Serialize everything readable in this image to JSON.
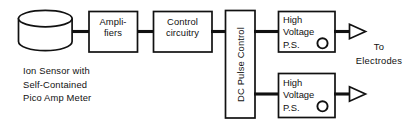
{
  "diagram": {
    "type": "block-diagram",
    "canvas": {
      "width": 417,
      "height": 126
    },
    "stroke_color": "#111111",
    "fill_color": "#ffffff",
    "background": "#ffffff",
    "nodes": [
      {
        "id": "ion-sensor",
        "shape": "cylinder",
        "label": "",
        "caption": "Ion Sensor with\nSelf-Contained\nPico Amp Meter"
      },
      {
        "id": "amplifiers",
        "shape": "rectangle",
        "label": "Ampli-\nfiers"
      },
      {
        "id": "control-circuitry",
        "shape": "rectangle",
        "label": "Control\ncircuitry"
      },
      {
        "id": "dc-pulse-control",
        "shape": "rectangle-vertical",
        "label": "DC Pulse Control",
        "text_orientation": "rotated-90-ccw"
      },
      {
        "id": "high-voltage-ps-upper",
        "shape": "rectangle",
        "label": "High\nVoltage\nP.S.",
        "has_knob": true
      },
      {
        "id": "high-voltage-ps-lower",
        "shape": "rectangle",
        "label": "High\nVoltage\nP.S.",
        "has_knob": true
      }
    ],
    "outputs": {
      "label": "To\nElectrodes",
      "arrow_style": "hollow-triangle",
      "count": 2
    },
    "edges": [
      {
        "from": "ion-sensor",
        "to": "amplifiers"
      },
      {
        "from": "amplifiers",
        "to": "control-circuitry"
      },
      {
        "from": "control-circuitry",
        "to": "dc-pulse-control"
      },
      {
        "from": "dc-pulse-control",
        "to": "high-voltage-ps-upper"
      },
      {
        "from": "dc-pulse-control",
        "to": "high-voltage-ps-lower"
      },
      {
        "from": "high-voltage-ps-upper",
        "to": "electrodes-output-upper"
      },
      {
        "from": "high-voltage-ps-lower",
        "to": "electrodes-output-lower"
      }
    ]
  }
}
